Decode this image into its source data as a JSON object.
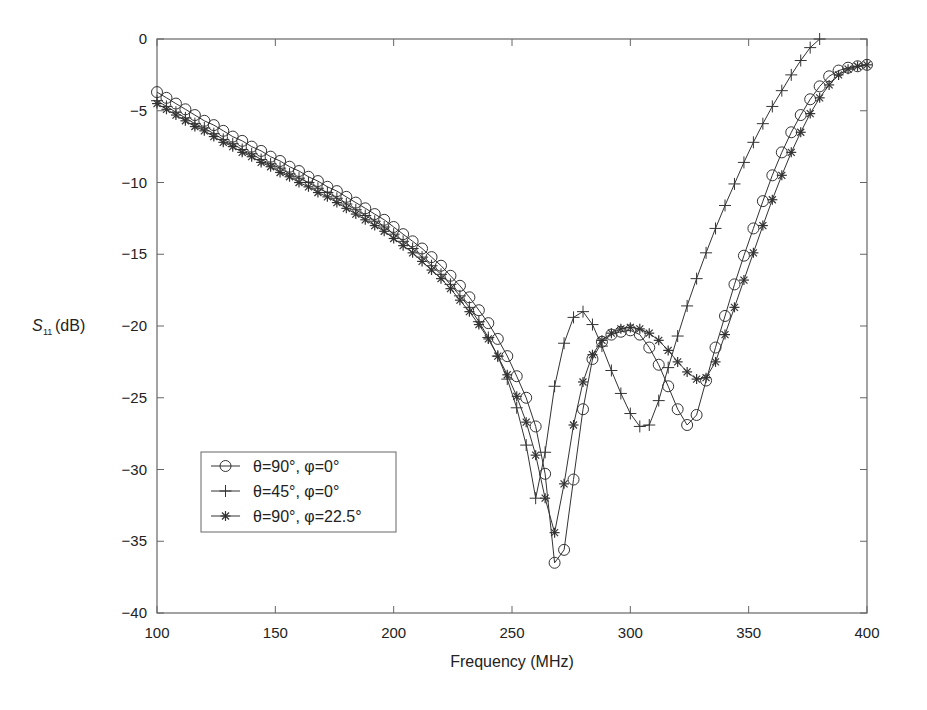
{
  "chart_data": {
    "type": "line",
    "title": "",
    "xlabel": "Frequency (MHz)",
    "ylabel": "S11 (dB)",
    "ylabel_main": "S",
    "ylabel_sub": "11",
    "ylabel_unit": "(dB)",
    "xlim": [
      100,
      400
    ],
    "ylim": [
      -40,
      0
    ],
    "xticks": [
      100,
      150,
      200,
      250,
      300,
      350,
      400
    ],
    "yticks": [
      0,
      -5,
      -10,
      -15,
      -20,
      -25,
      -30,
      -35,
      -40
    ],
    "xtick_labels": [
      "100",
      "150",
      "200",
      "250",
      "300",
      "350",
      "400"
    ],
    "ytick_labels": [
      "0",
      "−5",
      "−10",
      "−15",
      "−20",
      "−25",
      "−30",
      "−35",
      "−40"
    ],
    "grid": false,
    "legend_position": "lower left",
    "series": [
      {
        "name": "θ=90°, φ=0°",
        "marker": "circle",
        "points": [
          [
            100,
            -3.7
          ],
          [
            104,
            -4.1
          ],
          [
            108,
            -4.5
          ],
          [
            112,
            -4.9
          ],
          [
            116,
            -5.3
          ],
          [
            120,
            -5.7
          ],
          [
            124,
            -6.0
          ],
          [
            128,
            -6.4
          ],
          [
            132,
            -6.8
          ],
          [
            136,
            -7.1
          ],
          [
            140,
            -7.5
          ],
          [
            144,
            -7.8
          ],
          [
            148,
            -8.2
          ],
          [
            152,
            -8.5
          ],
          [
            156,
            -8.9
          ],
          [
            160,
            -9.2
          ],
          [
            164,
            -9.6
          ],
          [
            168,
            -9.9
          ],
          [
            172,
            -10.3
          ],
          [
            176,
            -10.6
          ],
          [
            180,
            -11.0
          ],
          [
            184,
            -11.4
          ],
          [
            188,
            -11.8
          ],
          [
            192,
            -12.2
          ],
          [
            196,
            -12.6
          ],
          [
            200,
            -13.1
          ],
          [
            204,
            -13.6
          ],
          [
            208,
            -14.1
          ],
          [
            212,
            -14.6
          ],
          [
            216,
            -15.2
          ],
          [
            220,
            -15.8
          ],
          [
            224,
            -16.5
          ],
          [
            228,
            -17.2
          ],
          [
            232,
            -18.0
          ],
          [
            236,
            -18.9
          ],
          [
            240,
            -19.8
          ],
          [
            244,
            -20.9
          ],
          [
            248,
            -22.1
          ],
          [
            252,
            -23.5
          ],
          [
            256,
            -25.0
          ],
          [
            260,
            -27.0
          ],
          [
            264,
            -30.3
          ],
          [
            268,
            -36.5
          ],
          [
            272,
            -35.6
          ],
          [
            276,
            -30.7
          ],
          [
            280,
            -25.8
          ],
          [
            284,
            -22.3
          ],
          [
            288,
            -21.1
          ],
          [
            292,
            -20.6
          ],
          [
            296,
            -20.4
          ],
          [
            300,
            -20.3
          ],
          [
            304,
            -20.6
          ],
          [
            308,
            -21.5
          ],
          [
            312,
            -22.7
          ],
          [
            316,
            -24.2
          ],
          [
            320,
            -25.8
          ],
          [
            324,
            -26.9
          ],
          [
            328,
            -26.2
          ],
          [
            332,
            -23.8
          ],
          [
            336,
            -21.5
          ],
          [
            340,
            -19.3
          ],
          [
            344,
            -17.1
          ],
          [
            348,
            -15.1
          ],
          [
            352,
            -13.2
          ],
          [
            356,
            -11.3
          ],
          [
            360,
            -9.5
          ],
          [
            364,
            -7.9
          ],
          [
            368,
            -6.5
          ],
          [
            372,
            -5.3
          ],
          [
            376,
            -4.2
          ],
          [
            380,
            -3.3
          ],
          [
            384,
            -2.6
          ],
          [
            388,
            -2.2
          ],
          [
            392,
            -2.0
          ],
          [
            396,
            -1.9
          ],
          [
            400,
            -1.8
          ]
        ]
      },
      {
        "name": "θ=45°, φ=0°",
        "marker": "plus",
        "points": [
          [
            100,
            -4.3
          ],
          [
            104,
            -4.7
          ],
          [
            108,
            -5.1
          ],
          [
            112,
            -5.5
          ],
          [
            116,
            -5.9
          ],
          [
            120,
            -6.2
          ],
          [
            124,
            -6.6
          ],
          [
            128,
            -7.0
          ],
          [
            132,
            -7.3
          ],
          [
            136,
            -7.7
          ],
          [
            140,
            -8.0
          ],
          [
            144,
            -8.4
          ],
          [
            148,
            -8.7
          ],
          [
            152,
            -9.0
          ],
          [
            156,
            -9.4
          ],
          [
            160,
            -9.7
          ],
          [
            164,
            -10.0
          ],
          [
            168,
            -10.4
          ],
          [
            172,
            -10.7
          ],
          [
            176,
            -11.1
          ],
          [
            180,
            -11.5
          ],
          [
            184,
            -11.9
          ],
          [
            188,
            -12.3
          ],
          [
            192,
            -12.7
          ],
          [
            196,
            -13.1
          ],
          [
            200,
            -13.6
          ],
          [
            204,
            -14.1
          ],
          [
            208,
            -14.6
          ],
          [
            212,
            -15.2
          ],
          [
            216,
            -15.8
          ],
          [
            220,
            -16.4
          ],
          [
            224,
            -17.1
          ],
          [
            228,
            -17.9
          ],
          [
            232,
            -18.7
          ],
          [
            236,
            -19.7
          ],
          [
            240,
            -20.8
          ],
          [
            244,
            -22.1
          ],
          [
            248,
            -23.7
          ],
          [
            252,
            -25.7
          ],
          [
            256,
            -28.3
          ],
          [
            260,
            -32.0
          ],
          [
            264,
            -28.8
          ],
          [
            268,
            -24.2
          ],
          [
            272,
            -21.2
          ],
          [
            276,
            -19.4
          ],
          [
            280,
            -19.0
          ],
          [
            284,
            -19.9
          ],
          [
            288,
            -21.4
          ],
          [
            292,
            -23.1
          ],
          [
            296,
            -24.7
          ],
          [
            300,
            -26.1
          ],
          [
            304,
            -27.0
          ],
          [
            308,
            -26.9
          ],
          [
            312,
            -25.2
          ],
          [
            316,
            -22.9
          ],
          [
            320,
            -20.7
          ],
          [
            324,
            -18.6
          ],
          [
            328,
            -16.7
          ],
          [
            332,
            -14.9
          ],
          [
            336,
            -13.2
          ],
          [
            340,
            -11.6
          ],
          [
            344,
            -10.1
          ],
          [
            348,
            -8.6
          ],
          [
            352,
            -7.2
          ],
          [
            356,
            -5.9
          ],
          [
            360,
            -4.7
          ],
          [
            364,
            -3.6
          ],
          [
            368,
            -2.5
          ],
          [
            372,
            -1.5
          ],
          [
            376,
            -0.6
          ],
          [
            380,
            0.0
          ]
        ]
      },
      {
        "name": "θ=90°, φ=22.5°",
        "marker": "star",
        "points": [
          [
            100,
            -4.5
          ],
          [
            104,
            -4.9
          ],
          [
            108,
            -5.3
          ],
          [
            112,
            -5.7
          ],
          [
            116,
            -6.1
          ],
          [
            120,
            -6.4
          ],
          [
            124,
            -6.8
          ],
          [
            128,
            -7.2
          ],
          [
            132,
            -7.5
          ],
          [
            136,
            -7.9
          ],
          [
            140,
            -8.2
          ],
          [
            144,
            -8.6
          ],
          [
            148,
            -8.9
          ],
          [
            152,
            -9.3
          ],
          [
            156,
            -9.6
          ],
          [
            160,
            -10.0
          ],
          [
            164,
            -10.3
          ],
          [
            168,
            -10.7
          ],
          [
            172,
            -11.0
          ],
          [
            176,
            -11.4
          ],
          [
            180,
            -11.8
          ],
          [
            184,
            -12.2
          ],
          [
            188,
            -12.6
          ],
          [
            192,
            -13.0
          ],
          [
            196,
            -13.4
          ],
          [
            200,
            -13.9
          ],
          [
            204,
            -14.4
          ],
          [
            208,
            -14.9
          ],
          [
            212,
            -15.5
          ],
          [
            216,
            -16.1
          ],
          [
            220,
            -16.7
          ],
          [
            224,
            -17.4
          ],
          [
            228,
            -18.2
          ],
          [
            232,
            -19.0
          ],
          [
            236,
            -19.9
          ],
          [
            240,
            -20.9
          ],
          [
            244,
            -22.1
          ],
          [
            248,
            -23.4
          ],
          [
            252,
            -24.9
          ],
          [
            256,
            -26.7
          ],
          [
            260,
            -29.0
          ],
          [
            264,
            -32.0
          ],
          [
            268,
            -34.4
          ],
          [
            272,
            -31.0
          ],
          [
            276,
            -26.9
          ],
          [
            280,
            -23.9
          ],
          [
            284,
            -22.0
          ],
          [
            288,
            -21.0
          ],
          [
            292,
            -20.5
          ],
          [
            296,
            -20.2
          ],
          [
            300,
            -20.1
          ],
          [
            304,
            -20.2
          ],
          [
            308,
            -20.5
          ],
          [
            312,
            -21.0
          ],
          [
            316,
            -21.7
          ],
          [
            320,
            -22.5
          ],
          [
            324,
            -23.2
          ],
          [
            328,
            -23.7
          ],
          [
            332,
            -23.6
          ],
          [
            336,
            -22.5
          ],
          [
            340,
            -20.6
          ],
          [
            344,
            -18.7
          ],
          [
            348,
            -16.8
          ],
          [
            352,
            -14.9
          ],
          [
            356,
            -13.0
          ],
          [
            360,
            -11.2
          ],
          [
            364,
            -9.5
          ],
          [
            368,
            -7.9
          ],
          [
            372,
            -6.5
          ],
          [
            376,
            -5.2
          ],
          [
            380,
            -4.1
          ],
          [
            384,
            -3.2
          ],
          [
            388,
            -2.5
          ],
          [
            392,
            -2.1
          ],
          [
            396,
            -1.9
          ],
          [
            400,
            -1.8
          ]
        ]
      }
    ]
  },
  "legend": {
    "items": [
      {
        "label": "θ=90°, φ=0°",
        "marker": "circle"
      },
      {
        "label": "θ=45°, φ=0°",
        "marker": "plus"
      },
      {
        "label": "θ=90°, φ=22.5°",
        "marker": "star"
      }
    ]
  },
  "colors": {
    "line": "#333333",
    "axis": "#555555",
    "text": "#222222",
    "background": "#ffffff"
  }
}
